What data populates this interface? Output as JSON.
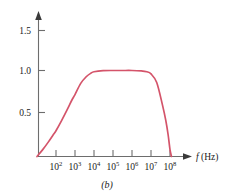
{
  "figure": {
    "caption": "(b)",
    "xaxis_title_symbol": "f",
    "xaxis_title_unit": " (Hz)"
  },
  "chart_data": {
    "type": "line",
    "title": "",
    "subtitle": "",
    "caption": "(b)",
    "xlabel": "f (Hz)",
    "ylabel": "",
    "xscale": "log",
    "xlim": [
      10,
      300000000
    ],
    "ylim": [
      0,
      1.7
    ],
    "grid": false,
    "legend": "none",
    "series_color": "#d4546a",
    "xticks": [
      100,
      1000,
      10000,
      100000,
      1000000,
      10000000,
      100000000
    ],
    "xticklabels": [
      "10²",
      "10³",
      "10⁴",
      "10⁵",
      "10⁶",
      "10⁷",
      "10⁸"
    ],
    "xtick_bases": [
      "10",
      "10",
      "10",
      "10",
      "10",
      "10",
      "10"
    ],
    "xtick_exponents": [
      "2",
      "3",
      "4",
      "5",
      "6",
      "7",
      "8"
    ],
    "yticks": [
      0.5,
      1.0,
      1.5
    ],
    "yticklabels": [
      "0.5",
      "1.0",
      "1.5"
    ],
    "annotations": [],
    "series": [
      {
        "name": "gain",
        "x": [
          10,
          20,
          40,
          70,
          100,
          200,
          400,
          700,
          1000,
          2000,
          4000,
          7000,
          10000,
          30000,
          100000,
          300000,
          1000000,
          3000000,
          6000000,
          10000000,
          20000000,
          40000000,
          60000000,
          80000000,
          100000000,
          120000000
        ],
        "values": [
          0.0,
          0.08,
          0.17,
          0.25,
          0.3,
          0.42,
          0.55,
          0.66,
          0.72,
          0.85,
          0.93,
          0.97,
          0.985,
          0.998,
          1.0,
          1.0,
          1.0,
          0.995,
          0.985,
          0.96,
          0.86,
          0.6,
          0.42,
          0.25,
          0.08,
          0.0
        ]
      }
    ]
  }
}
